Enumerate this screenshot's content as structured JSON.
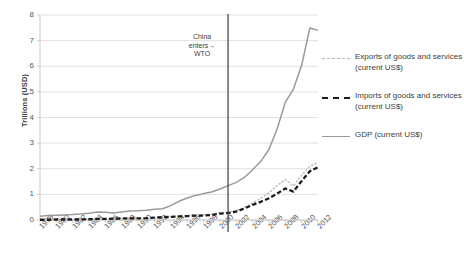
{
  "chart_data": {
    "type": "line",
    "title": "",
    "xlabel": "",
    "ylabel": "Trillions (USD)",
    "ylim": [
      0,
      8
    ],
    "xlim": [
      1978,
      2012
    ],
    "grid": true,
    "legend_position": "right",
    "y_ticks": [
      "0",
      "1",
      "2",
      "3",
      "4",
      "5",
      "6",
      "7",
      "8"
    ],
    "x_ticks": [
      "1978",
      "1980",
      "1982",
      "1984",
      "1986",
      "1988",
      "1990",
      "1992",
      "1994",
      "1996",
      "1998",
      "2000",
      "2002",
      "2004",
      "2006",
      "2008",
      "2010",
      "2012"
    ],
    "x": [
      1978,
      1979,
      1980,
      1981,
      1982,
      1983,
      1984,
      1985,
      1986,
      1987,
      1988,
      1989,
      1990,
      1991,
      1992,
      1993,
      1994,
      1995,
      1996,
      1997,
      1998,
      1999,
      2000,
      2001,
      2002,
      2003,
      2004,
      2005,
      2006,
      2007,
      2008,
      2009,
      2010,
      2011,
      2012
    ],
    "series": [
      {
        "name": "GDP (current US$)",
        "style": "solid",
        "color": "#9a9a9a",
        "values": [
          0.15,
          0.18,
          0.19,
          0.2,
          0.21,
          0.23,
          0.26,
          0.31,
          0.3,
          0.27,
          0.31,
          0.35,
          0.36,
          0.38,
          0.42,
          0.44,
          0.56,
          0.73,
          0.86,
          0.96,
          1.03,
          1.09,
          1.21,
          1.34,
          1.47,
          1.66,
          1.96,
          2.29,
          2.75,
          3.55,
          4.59,
          5.11,
          6.04,
          7.49,
          7.4
        ]
      },
      {
        "name": "Exports of goods and services (current US$)",
        "style": "dotted",
        "color": "#b9b9b9",
        "values": [
          0.01,
          0.01,
          0.02,
          0.02,
          0.02,
          0.02,
          0.03,
          0.03,
          0.04,
          0.05,
          0.06,
          0.06,
          0.07,
          0.08,
          0.09,
          0.1,
          0.13,
          0.15,
          0.17,
          0.21,
          0.21,
          0.22,
          0.28,
          0.3,
          0.37,
          0.49,
          0.66,
          0.84,
          1.06,
          1.34,
          1.58,
          1.33,
          1.75,
          2.09,
          2.25
        ]
      },
      {
        "name": "Imports of goods and services (current US$)",
        "style": "dashed",
        "color": "#1c1c1c",
        "values": [
          0.01,
          0.01,
          0.02,
          0.02,
          0.02,
          0.02,
          0.03,
          0.04,
          0.04,
          0.05,
          0.06,
          0.06,
          0.06,
          0.07,
          0.09,
          0.11,
          0.12,
          0.14,
          0.15,
          0.17,
          0.17,
          0.2,
          0.25,
          0.27,
          0.33,
          0.45,
          0.59,
          0.71,
          0.85,
          1.03,
          1.23,
          1.11,
          1.52,
          1.9,
          2.06
        ]
      }
    ],
    "annotations": [
      {
        "id": "wto-marker",
        "text_line1": "China",
        "text_line2": "enters",
        "text_line3": "WTO",
        "arrow": "→",
        "at_x": 2001,
        "line_color": "#4a4a4a"
      }
    ]
  },
  "legend": {
    "items": [
      {
        "swatch": "exports-dotted-swatch",
        "label_line1": "Exports of goods and services",
        "label_line2": "(current US$)"
      },
      {
        "swatch": "imports-dashed-swatch",
        "label_line1": "Imports of goods and services",
        "label_line2": "(current US$)"
      },
      {
        "swatch": "gdp-solid-swatch",
        "label_line1": "GDP (current US$)",
        "label_line2": ""
      }
    ]
  }
}
